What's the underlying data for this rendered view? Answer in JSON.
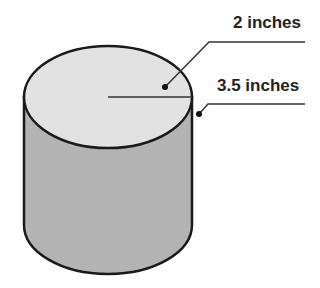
{
  "diagram": {
    "shape": "cylinder",
    "labels": {
      "radius": "2 inches",
      "height": "3.5 inches"
    },
    "colors": {
      "top_fill": "#e2e2e2",
      "side_fill": "#b3b3b3",
      "outline": "#1a1a1a",
      "text": "#222222"
    }
  }
}
